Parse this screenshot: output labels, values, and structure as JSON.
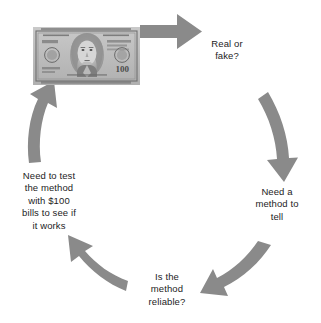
{
  "diagram": {
    "type": "cycle",
    "title": "",
    "background_color": "#ffffff",
    "arrow_color": "#8a8a8a",
    "text_color": "#1d1d1d",
    "nodes": [
      {
        "id": "bill",
        "kind": "image",
        "label": "$100 bill photograph",
        "icon": "hundred-dollar-bill-image"
      },
      {
        "id": "real-fake",
        "kind": "text",
        "label": "Real or\nfake?"
      },
      {
        "id": "need-method",
        "kind": "text",
        "label": "Need a\nmethod to\ntell"
      },
      {
        "id": "reliable",
        "kind": "text",
        "label": "Is the\nmethod\nreliable?"
      },
      {
        "id": "need-test",
        "kind": "text",
        "label": "Need to test\nthe method\nwith $100\nbills to see if\nit works"
      }
    ],
    "arrows": [
      {
        "id": "arrow-bill-to-real-fake",
        "from": "bill",
        "to": "real-fake",
        "direction": "right",
        "shape": "straight"
      },
      {
        "id": "arrow-real-fake-to-need-method",
        "from": "real-fake",
        "to": "need-method",
        "direction": "down",
        "shape": "curved"
      },
      {
        "id": "arrow-need-method-to-reliable",
        "from": "need-method",
        "to": "reliable",
        "direction": "down-left",
        "shape": "curved"
      },
      {
        "id": "arrow-reliable-to-need-test",
        "from": "reliable",
        "to": "need-test",
        "direction": "up-left",
        "shape": "curved"
      },
      {
        "id": "arrow-need-test-to-bill",
        "from": "need-test",
        "to": "bill",
        "direction": "up",
        "shape": "curved"
      }
    ]
  },
  "bill": {
    "denomination": "100",
    "portrait": "benjamin-franklin",
    "serial_text": "100",
    "country_text": "THE UNITED STATES OF AMERICA"
  }
}
